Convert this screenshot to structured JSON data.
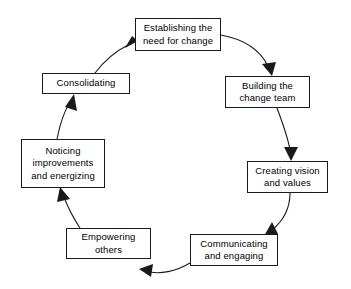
{
  "diagram": {
    "type": "cycle",
    "title": "",
    "direction": "clockwise",
    "node_count": 8,
    "colors": {
      "background": "#ffffff",
      "box_border": "#1a1a1a",
      "box_fill": "#ffffff",
      "text": "#000000",
      "arrow": "#1a1a1a"
    },
    "nodes": [
      {
        "id": "establishing-need-for-change",
        "label": "Establishing the\nneed for change",
        "order": 1,
        "x": 135,
        "y": 18,
        "w": 86,
        "h": 33
      },
      {
        "id": "building-change-team",
        "label": "Building the\nchange team",
        "order": 2,
        "x": 225,
        "y": 76,
        "w": 85,
        "h": 32
      },
      {
        "id": "creating-vision-and-values",
        "label": "Creating vision\nand values",
        "order": 3,
        "x": 247,
        "y": 161,
        "w": 81,
        "h": 32
      },
      {
        "id": "communicating-and-engaging",
        "label": "Communicating\nand engaging",
        "order": 4,
        "x": 190,
        "y": 234,
        "w": 88,
        "h": 32
      },
      {
        "id": "empowering-others",
        "label": "Empowering\nothers",
        "order": 5,
        "x": 66,
        "y": 228,
        "w": 85,
        "h": 31
      },
      {
        "id": "noticing-improvements-and-energizing",
        "label": "Noticing\nimprovements\nand energizing",
        "order": 6,
        "x": 21,
        "y": 139,
        "w": 84,
        "h": 49
      },
      {
        "id": "consolidating",
        "label": "Consolidating",
        "order": 7,
        "x": 42,
        "y": 73,
        "w": 88,
        "h": 21
      }
    ],
    "arrows": [
      {
        "id": "arrow-establishing-to-building",
        "from": "establishing-need-for-change",
        "to": "building-change-team"
      },
      {
        "id": "arrow-building-to-creating",
        "from": "building-change-team",
        "to": "creating-vision-and-values"
      },
      {
        "id": "arrow-creating-to-communicating",
        "from": "creating-vision-and-values",
        "to": "communicating-and-engaging"
      },
      {
        "id": "arrow-communicating-to-empowering",
        "from": "communicating-and-engaging",
        "to": "empowering-others"
      },
      {
        "id": "arrow-empowering-to-noticing",
        "from": "empowering-others",
        "to": "noticing-improvements-and-energizing"
      },
      {
        "id": "arrow-noticing-to-consolidating",
        "from": "noticing-improvements-and-energizing",
        "to": "consolidating"
      },
      {
        "id": "arrow-consolidating-to-establishing",
        "from": "consolidating",
        "to": "establishing-need-for-change"
      }
    ]
  }
}
